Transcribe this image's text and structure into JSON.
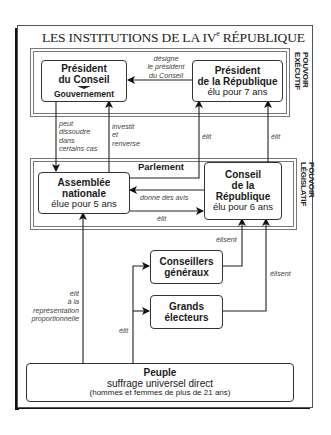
{
  "title": {
    "prefix": "LES INSTITUTIONS DE LA IV",
    "sup": "e",
    "suffix": " RÉPUBLIQUE"
  },
  "sections": {
    "executif": "POUVOIR EXÉCUTIF",
    "legislatif": "POUVOIR LÉGISLATIF",
    "parlement": "Parlement"
  },
  "boxes": {
    "president_conseil": {
      "line1": "Président",
      "line2": "du Conseil",
      "sub": "Gouvernement"
    },
    "president_republique": {
      "line1": "Président",
      "line2": "de la République",
      "sub": "élu pour 7 ans"
    },
    "assemblee": {
      "line1": "Assemblée",
      "line2": "nationale",
      "sub": "élue pour 5 ans"
    },
    "conseil_republique": {
      "line1": "Conseil",
      "line2": "de la",
      "line3": "République",
      "sub": "élu pour 6 ans"
    },
    "conseillers": {
      "line1": "Conseillers",
      "line2": "généraux"
    },
    "grands_electeurs": {
      "line1": "Grands",
      "line2": "électeurs"
    },
    "peuple": {
      "line1": "Peuple",
      "line2": "suffrage universel direct",
      "line3": "(hommes et femmes de plus de 21 ans)"
    }
  },
  "arrows": {
    "designe": [
      "désigne",
      "le président",
      "du Conseil"
    ],
    "dissoudre": [
      "peut",
      "dissoudre",
      "dans",
      "certains cas"
    ],
    "investit": [
      "investit",
      "et",
      "renverse"
    ],
    "elit_pr_1": "élit",
    "elit_pr_2": "élit",
    "donne_avis": "donne des avis",
    "elit_an_cr": "élit",
    "elisent_cg": "élisent",
    "elisent_ge": "élisent",
    "elit_proportionnelle": [
      "élit",
      "à la",
      "représentation",
      "proportionnelle"
    ],
    "elit_peuple": "élit"
  }
}
